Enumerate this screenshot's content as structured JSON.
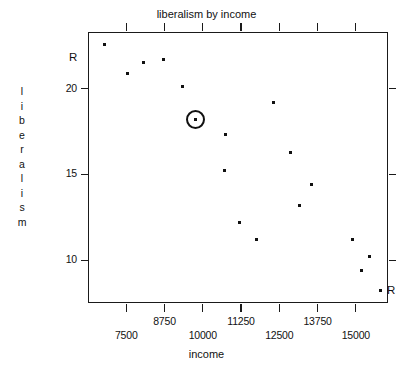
{
  "chart_data": {
    "type": "scatter",
    "title": "liberalism by income",
    "xlabel": "income",
    "ylabel": "liberalism",
    "xlim": [
      6250,
      16050
    ],
    "ylim": [
      7.5,
      23.3
    ],
    "xticks": [
      7500,
      8750,
      10000,
      11250,
      12500,
      13750,
      15000
    ],
    "xtick_labels": [
      "7500",
      "8750",
      "10000",
      "11250",
      "12500",
      "13750",
      "15000"
    ],
    "xtick_label_stagger": true,
    "yticks": [
      10,
      15,
      20
    ],
    "ytick_labels": [
      "10",
      "15",
      "20"
    ],
    "grid": false,
    "legend": null,
    "point_labels": [
      {
        "text": "R",
        "x": 6600,
        "y": 21.8,
        "position": "left-of-axis"
      },
      {
        "text": "R",
        "x": 15850,
        "y": 8.2,
        "position": "right-of-point"
      }
    ],
    "highlight": {
      "x": 9750,
      "y": 18.2,
      "style": "circle-ring"
    },
    "points": [
      {
        "x": 6800,
        "y": 22.6
      },
      {
        "x": 8050,
        "y": 21.5
      },
      {
        "x": 8700,
        "y": 21.7
      },
      {
        "x": 7550,
        "y": 20.9
      },
      {
        "x": 9350,
        "y": 20.1
      },
      {
        "x": 12300,
        "y": 19.2
      },
      {
        "x": 9750,
        "y": 18.2
      },
      {
        "x": 10750,
        "y": 17.3
      },
      {
        "x": 12850,
        "y": 16.3
      },
      {
        "x": 10700,
        "y": 15.2
      },
      {
        "x": 13550,
        "y": 14.4
      },
      {
        "x": 13150,
        "y": 13.2
      },
      {
        "x": 11200,
        "y": 12.2
      },
      {
        "x": 11750,
        "y": 11.2
      },
      {
        "x": 14900,
        "y": 11.2
      },
      {
        "x": 15450,
        "y": 10.2
      },
      {
        "x": 15200,
        "y": 9.4
      },
      {
        "x": 15800,
        "y": 8.2
      }
    ],
    "colors": {
      "point": "#111111",
      "axis": "#1a1a1a",
      "background": "#ffffff",
      "text": "#111111"
    }
  }
}
